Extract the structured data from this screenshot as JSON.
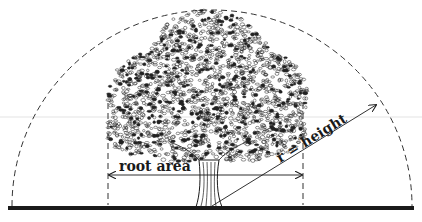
{
  "diagram": {
    "type": "tree root area illustration",
    "labels": {
      "root_area": "root area",
      "radius": "r = height"
    },
    "colors": {
      "ink": "#1a1a1a",
      "background": "#ffffff",
      "faint_line": "#d8d8d8"
    },
    "elements": {
      "ground_line": "solid thick ground line",
      "arc": "dashed semicircular arc centered at the trunk base with radius equal to tree height",
      "root_area_bounds": "two dashed vertical lines at the crown drip line",
      "root_area_arrow": "double-headed horizontal arrow between the drip lines",
      "radius_arrow": "arrow from trunk base to the arc",
      "tree": "stippled deciduous tree with a broad crown and fluted trunk"
    }
  }
}
